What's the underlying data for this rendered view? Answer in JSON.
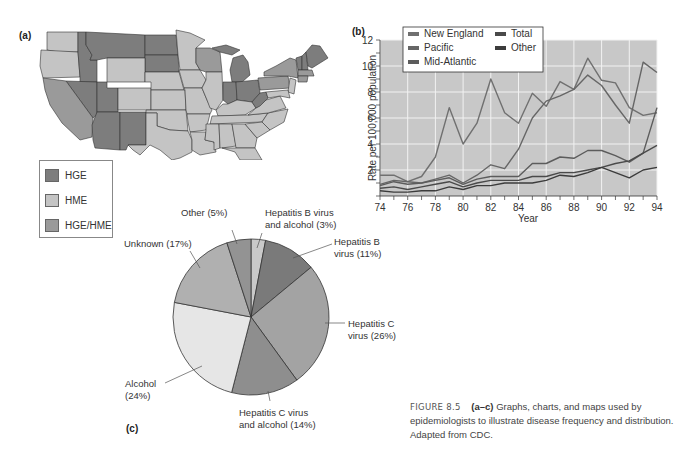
{
  "panels": {
    "a": "(a)",
    "b": "(b)",
    "c": "(c)"
  },
  "map": {
    "legend": [
      {
        "label": "HGE",
        "color": "#7d7d7d"
      },
      {
        "label": "HME",
        "color": "#c4c4c4"
      },
      {
        "label": "HGE/HME",
        "color": "#9a9a9a"
      }
    ],
    "colors": {
      "hge": "#7d7d7d",
      "hme": "#c4c4c4",
      "both": "#9a9a9a",
      "border": "#333333"
    }
  },
  "caption": {
    "figure": "FIGURE 8.5",
    "range": "(a–c)",
    "text": "Graphs, charts, and maps used by epidemiologists to illustrate disease frequency and distribution. Adapted from CDC."
  },
  "chart_data": [
    {
      "type": "line",
      "panel": "(b)",
      "title": "",
      "xlabel": "Year",
      "ylabel": "Rate per 100,000 population",
      "x": [
        74,
        75,
        76,
        77,
        78,
        79,
        80,
        81,
        82,
        83,
        84,
        85,
        86,
        87,
        88,
        89,
        90,
        91,
        92,
        93,
        94
      ],
      "xticks": [
        "74",
        "76",
        "78",
        "80",
        "82",
        "84",
        "86",
        "88",
        "90",
        "92",
        "94"
      ],
      "yticks": [
        "2",
        "4",
        "6",
        "8",
        "10",
        "12"
      ],
      "ylim": [
        0,
        12
      ],
      "xlim": [
        74,
        94
      ],
      "grid": true,
      "legend_position": "top-left inside",
      "background": "#c8c8c8",
      "series": [
        {
          "name": "New England",
          "color": "#707070",
          "values": [
            1.6,
            1.6,
            1.1,
            1.5,
            3.0,
            6.8,
            4.0,
            5.6,
            9.0,
            6.4,
            5.6,
            7.9,
            6.9,
            8.8,
            8.2,
            10.6,
            8.9,
            8.7,
            6.8,
            6.2,
            6.4
          ]
        },
        {
          "name": "Pacific",
          "color": "#666666",
          "values": [
            0.9,
            1.2,
            1.1,
            1.0,
            1.3,
            1.6,
            1.0,
            1.6,
            2.4,
            2.1,
            3.6,
            6.0,
            7.3,
            7.7,
            8.2,
            9.3,
            8.5,
            7.0,
            5.6,
            10.3,
            9.5
          ]
        },
        {
          "name": "Mid-Atlantic",
          "color": "#5c5c5c",
          "values": [
            0.8,
            1.1,
            0.9,
            1.0,
            1.2,
            1.4,
            0.9,
            1.3,
            1.5,
            1.5,
            1.5,
            2.5,
            2.5,
            3.0,
            2.9,
            3.5,
            3.5,
            3.1,
            2.6,
            3.3,
            6.8
          ]
        },
        {
          "name": "Total",
          "color": "#4a4a4a",
          "values": [
            0.6,
            0.7,
            0.5,
            0.7,
            0.9,
            1.1,
            0.7,
            1.0,
            1.2,
            1.2,
            1.2,
            1.5,
            1.5,
            1.8,
            1.8,
            2.0,
            2.2,
            2.5,
            2.7,
            3.3,
            3.9
          ]
        },
        {
          "name": "Other",
          "color": "#3c3c3c",
          "values": [
            0.4,
            0.3,
            0.3,
            0.4,
            0.4,
            0.7,
            0.5,
            0.8,
            0.8,
            1.0,
            1.0,
            1.0,
            1.2,
            1.6,
            1.5,
            1.8,
            2.2,
            1.8,
            1.4,
            2.0,
            2.2
          ]
        }
      ]
    },
    {
      "type": "pie",
      "panel": "(c)",
      "title": "",
      "start_angle": "12 o'clock, clockwise",
      "categories": [
        "Hepatitis B virus and alcohol",
        "Hepatitis B virus",
        "Hepatitis C virus",
        "Hepatitis C virus and alcohol",
        "Alcohol",
        "Unknown",
        "Other"
      ],
      "values": [
        3,
        11,
        26,
        14,
        24,
        17,
        5
      ],
      "colors": [
        "#c9c9c9",
        "#7a7a7a",
        "#a3a3a3",
        "#8e8e8e",
        "#e6e6e6",
        "#b0b0b0",
        "#939393"
      ],
      "labels": [
        [
          "Hepatitis B virus",
          "and alcohol (3%)"
        ],
        [
          "Hepatitis B",
          "virus (11%)"
        ],
        [
          "Hepatitis C",
          "virus (26%)"
        ],
        [
          "Hepatitis C virus",
          "and alcohol (14%)"
        ],
        [
          "Alcohol",
          "(24%)"
        ],
        [
          "Unknown (17%)"
        ],
        [
          "Other (5%)"
        ]
      ]
    }
  ]
}
